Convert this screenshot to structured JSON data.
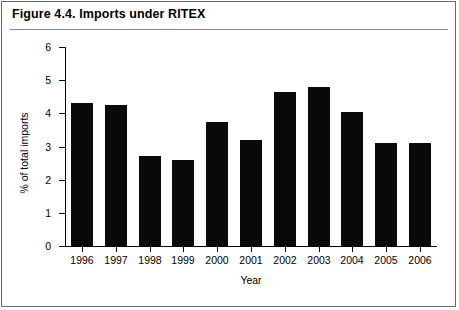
{
  "figure": {
    "title": "Figure 4.4. Imports under RITEX",
    "border_color": "#6b6b6b",
    "bar_color": "#0a0a0a"
  },
  "chart_data": {
    "type": "bar",
    "title": "Figure 4.4. Imports under RITEX",
    "xlabel": "Year",
    "ylabel": "% of total imports",
    "categories": [
      "1996",
      "1997",
      "1998",
      "1999",
      "2000",
      "2001",
      "2002",
      "2003",
      "2004",
      "2005",
      "2006"
    ],
    "values": [
      4.3,
      4.25,
      2.7,
      2.6,
      3.75,
      3.2,
      4.65,
      4.8,
      4.05,
      3.1,
      3.1
    ],
    "ylim": [
      0,
      6
    ],
    "ytick_labels": [
      "0",
      "1",
      "2",
      "3",
      "4",
      "5",
      "6"
    ],
    "ytick_values": [
      0,
      1,
      2,
      3,
      4,
      5,
      6
    ],
    "grid": false,
    "legend": false,
    "series_name": "Imports under RITEX"
  }
}
